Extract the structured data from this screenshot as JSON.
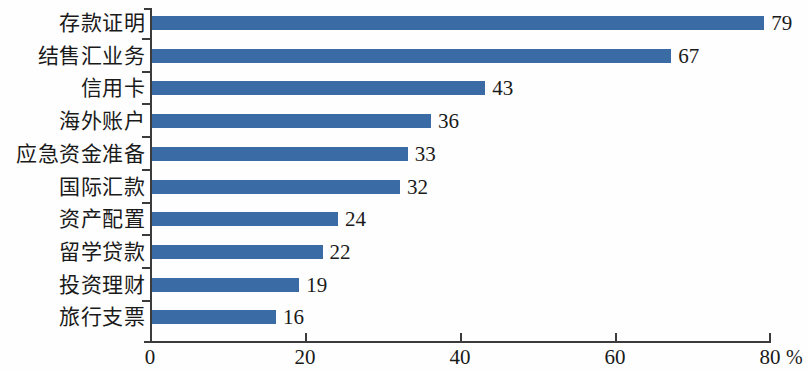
{
  "chart_data": {
    "type": "bar",
    "orientation": "horizontal",
    "title": "",
    "subtitle": "",
    "xlabel": "%",
    "ylabel": "",
    "categories": [
      "存款证明",
      "结售汇业务",
      "信用卡",
      "海外账户",
      "应急资金准备",
      "国际汇款",
      "资产配置",
      "留学贷款",
      "投资理财",
      "旅行支票"
    ],
    "values": [
      79,
      67,
      43,
      36,
      33,
      32,
      24,
      22,
      19,
      16
    ],
    "value_labels": [
      "79",
      "67",
      "43",
      "36",
      "33",
      "32",
      "24",
      "22",
      "19",
      "16"
    ],
    "xlim": [
      0,
      80
    ],
    "xticks": [
      0,
      20,
      40,
      60,
      80
    ],
    "xtick_labels": [
      "0",
      "20",
      "40",
      "60",
      "80"
    ],
    "unit": "%",
    "grid": false,
    "legend": null,
    "bar_color": "#3a6ba5",
    "axis_color": "#3b3b3b",
    "background": "#ffffff"
  }
}
